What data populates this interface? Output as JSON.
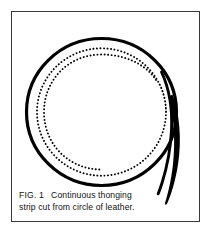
{
  "plate": {
    "background_color": "#ffffff",
    "frame_color": "#3a3a3a",
    "ink_color": "#000000"
  },
  "caption": {
    "label": "FIG. 1",
    "line1_text": "Continuous thonging",
    "line2_text": "strip cut from circle of leather.",
    "full_text": "FIG. 1  Continuous thonging strip cut from circle of leather."
  },
  "diagram": {
    "title": "Continuous thonging strip cut from circle of leather",
    "type": "line-illustration",
    "center": {
      "x": 88,
      "y": 88
    },
    "outer_radius": 76,
    "solid_spiral": {
      "name": "thonging-strip-outer-edge",
      "stroke_color": "#000000",
      "stroke_width": 3.1,
      "turns": 1.12,
      "start_angle_deg": -12,
      "description": "Heavy black spiral forming the rim of the leather circle and the outer edge of the cut strip."
    },
    "dotted_spiral": {
      "name": "cut-line-dotted-spiral",
      "stroke_color": "#000000",
      "dot_size": 1.5,
      "dot_gap": 3.2,
      "turns": 2.05,
      "inner_radius": 58,
      "outer_radius": 70,
      "description": "Dotted spiral showing the continuing cut path inside the leather circle."
    },
    "strip_tail": {
      "name": "tapered-strip-tail",
      "stroke_color": "#000000",
      "tip": {
        "x": 160,
        "y": 196
      },
      "description": "Narrow tapering sliver of cut strip peeling away to the lower right, ending in a point."
    }
  }
}
